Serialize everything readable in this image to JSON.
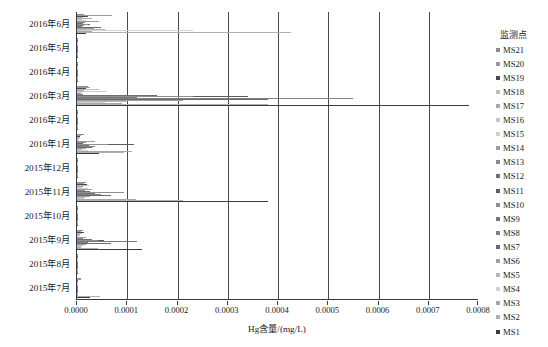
{
  "chart_data": {
    "type": "bar",
    "orientation": "horizontal",
    "title": "",
    "xlabel": "Hg含量/(mg/L)",
    "ylabel": "",
    "xlim": [
      0,
      0.0008
    ],
    "xticks": [
      "0.0000",
      "0.0001",
      "0.0002",
      "0.0003",
      "0.0004",
      "0.0005",
      "0.0006",
      "0.0007",
      "0.0008"
    ],
    "xtick_values": [
      0,
      0.0001,
      0.0002,
      0.0003,
      0.0004,
      0.0005,
      0.0006,
      0.0007,
      0.0008
    ],
    "grid": "vertical",
    "legend_position": "right",
    "legend_title": "监测点",
    "categories": [
      "2016年6月",
      "2016年5月",
      "2016年4月",
      "2016年3月",
      "2016年2月",
      "2016年1月",
      "2015年12月",
      "2015年11月",
      "2015年10月",
      "2015年9月",
      "2015年8月",
      "2015年7月"
    ],
    "series": [
      {
        "name": "MS21",
        "color": "#8c8c8c",
        "values": [
          1.4e-05,
          1.5e-06,
          1e-06,
          2.1e-05,
          1.6e-06,
          1.3e-05,
          1.4e-06,
          1.7e-05,
          1.8e-06,
          1.1e-05,
          1.6e-06,
          8e-06
        ]
      },
      {
        "name": "MS20",
        "color": "#9a9a9a",
        "values": [
          7e-05,
          1.8e-06,
          1.2e-06,
          2.6e-05,
          1.9e-06,
          8e-06,
          1.2e-06,
          1.4e-05,
          1.6e-06,
          7e-06,
          1.3e-06,
          7e-06
        ]
      },
      {
        "name": "MS19",
        "color": "#4a4a4a",
        "values": [
          2.2e-05,
          1.2e-06,
          8e-07,
          1.7e-05,
          1.4e-06,
          6e-06,
          1e-06,
          1.9e-05,
          1.2e-06,
          1.4e-05,
          1e-06,
          2e-06
        ]
      },
      {
        "name": "MS18",
        "color": "#bdbdbd",
        "values": [
          1.2e-05,
          1e-06,
          7e-07,
          4.4e-05,
          1.1e-06,
          5e-06,
          9e-07,
          2.4e-05,
          1e-06,
          1e-05,
          9e-07,
          1.5e-06
        ]
      },
      {
        "name": "MS17",
        "color": "#a8a8a8",
        "values": [
          3e-05,
          9e-07,
          6e-07,
          1.3e-05,
          1e-06,
          4e-06,
          8e-07,
          1.2e-05,
          9e-07,
          6e-06,
          8e-07,
          1.2e-06
        ]
      },
      {
        "name": "MS16",
        "color": "#c9c9c9",
        "values": [
          9e-06,
          8e-07,
          5e-07,
          5.7e-05,
          9e-07,
          3e-06,
          7e-07,
          9e-06,
          8e-07,
          5e-06,
          7e-07,
          1e-06
        ]
      },
      {
        "name": "MS15",
        "color": "#cfcfcf",
        "values": [
          1.8e-05,
          7e-07,
          5e-07,
          9e-06,
          8e-07,
          3e-06,
          6e-07,
          2.1e-05,
          7e-07,
          4e-06,
          6e-07,
          9e-07
        ]
      },
      {
        "name": "MS14",
        "color": "#9e9e9e",
        "values": [
          4.4e-05,
          7e-07,
          4e-07,
          8e-06,
          7e-07,
          3.5e-05,
          6e-07,
          3e-05,
          7e-07,
          1.8e-05,
          6e-07,
          9e-07
        ]
      },
      {
        "name": "MS13",
        "color": "#8a8a8a",
        "values": [
          1.6e-05,
          6e-07,
          4e-07,
          1.2e-05,
          7e-07,
          1.8e-05,
          5e-07,
          1.6e-05,
          6e-07,
          1.2e-05,
          5e-07,
          8e-07
        ]
      },
      {
        "name": "MS12",
        "color": "#6e6e6e",
        "values": [
          1.1e-05,
          6e-07,
          4e-07,
          0.00016,
          6e-07,
          1.2e-05,
          5e-07,
          2.6e-05,
          6e-07,
          3e-05,
          5e-07,
          8e-07
        ]
      },
      {
        "name": "MS11",
        "color": "#5e5e5e",
        "values": [
          2.6e-05,
          5e-07,
          3e-07,
          0.00034,
          6e-07,
          0.000113,
          4e-07,
          6e-05,
          5e-07,
          5.4e-05,
          4e-07,
          7e-07
        ]
      },
      {
        "name": "MS10",
        "color": "#8f8f8f",
        "values": [
          2.1e-05,
          5e-07,
          3e-07,
          0.00023,
          5e-07,
          6.2e-05,
          4e-07,
          9.4e-05,
          5e-07,
          4.1e-05,
          4e-07,
          7e-07
        ]
      },
      {
        "name": "MS9",
        "color": "#777777",
        "values": [
          1.3e-05,
          4e-07,
          3e-07,
          0.00012,
          5e-07,
          2.4e-05,
          4e-07,
          3.6e-05,
          4e-07,
          0.00012,
          4e-07,
          6e-07
        ]
      },
      {
        "name": "MS8",
        "color": "#828282",
        "values": [
          1e-05,
          4e-07,
          2e-07,
          0.00055,
          4e-07,
          3.6e-05,
          3e-07,
          4.8e-05,
          4e-07,
          2.2e-05,
          3e-07,
          6e-07
        ]
      },
      {
        "name": "MS7",
        "color": "#6a6a6a",
        "values": [
          4.8e-05,
          3e-07,
          2e-07,
          0.00038,
          4e-07,
          3e-05,
          3e-07,
          6.8e-05,
          3e-07,
          6.8e-05,
          3e-07,
          5e-07
        ]
      },
      {
        "name": "MS6",
        "color": "#a0a0a0",
        "values": [
          3.4e-05,
          3e-07,
          2e-07,
          0.00021,
          3e-07,
          1.8e-05,
          3e-07,
          2.6e-05,
          3e-07,
          1.7e-05,
          3e-07,
          5e-07
        ]
      },
      {
        "name": "MS5",
        "color": "#b5b5b5",
        "values": [
          5.5e-05,
          3e-07,
          2e-07,
          9.8e-05,
          3e-07,
          9e-06,
          2e-07,
          1.6e-05,
          3e-07,
          1.1e-05,
          2e-07,
          4e-07
        ]
      },
      {
        "name": "MS4",
        "color": "#d2d2d2",
        "values": [
          0.00023,
          2e-07,
          2e-07,
          5.6e-05,
          3e-07,
          2.1e-05,
          2e-07,
          1.3e-05,
          2e-07,
          8e-06,
          2e-07,
          4e-07
        ]
      },
      {
        "name": "MS3",
        "color": "#a6a6a6",
        "values": [
          3e-05,
          2e-07,
          1e-07,
          9e-05,
          2e-07,
          0.00011,
          2e-07,
          0.000118,
          2e-07,
          7e-06,
          2e-07,
          4e-07
        ]
      },
      {
        "name": "MS2",
        "color": "#b0b0b0",
        "values": [
          0.000425,
          2e-07,
          1e-07,
          0.00038,
          2e-07,
          9.3e-05,
          2e-07,
          0.00021,
          2e-07,
          4.2e-05,
          2e-07,
          4.6e-05
        ]
      },
      {
        "name": "MS1",
        "color": "#3c3c3c",
        "values": [
          1.8e-05,
          1e-07,
          1e-07,
          0.00078,
          2e-07,
          4.4e-05,
          1e-07,
          0.00038,
          1e-07,
          0.00013,
          1e-07,
          2.6e-05
        ]
      }
    ]
  },
  "legend": {
    "title": "监测点",
    "items": [
      {
        "label": "MS21",
        "color": "#8c8c8c"
      },
      {
        "label": "MS20",
        "color": "#9a9a9a"
      },
      {
        "label": "MS19",
        "color": "#4a4a4a"
      },
      {
        "label": "MS18",
        "color": "#bdbdbd"
      },
      {
        "label": "MS17",
        "color": "#a8a8a8"
      },
      {
        "label": "MS16",
        "color": "#c9c9c9"
      },
      {
        "label": "MS15",
        "color": "#cfcfcf"
      },
      {
        "label": "MS14",
        "color": "#9e9e9e"
      },
      {
        "label": "MS13",
        "color": "#8a8a8a"
      },
      {
        "label": "MS12",
        "color": "#6e6e6e"
      },
      {
        "label": "MS11",
        "color": "#5e5e5e"
      },
      {
        "label": "MS10",
        "color": "#8f8f8f"
      },
      {
        "label": "MS9",
        "color": "#777777"
      },
      {
        "label": "MS8",
        "color": "#828282"
      },
      {
        "label": "MS7",
        "color": "#6a6a6a"
      },
      {
        "label": "MS6",
        "color": "#a0a0a0"
      },
      {
        "label": "MS5",
        "color": "#b5b5b5"
      },
      {
        "label": "MS4",
        "color": "#d2d2d2"
      },
      {
        "label": "MS3",
        "color": "#a6a6a6"
      },
      {
        "label": "MS2",
        "color": "#b0b0b0"
      },
      {
        "label": "MS1",
        "color": "#3c3c3c"
      }
    ]
  },
  "axis": {
    "x_title": "Hg含量/(mg/L)"
  }
}
